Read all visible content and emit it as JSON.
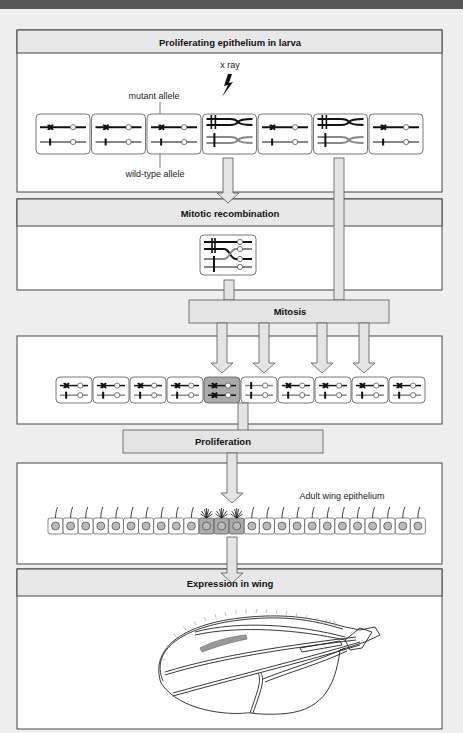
{
  "panels": {
    "larva": {
      "title": "Proliferating epithelium in larva"
    },
    "recombination": {
      "title": "Mitotic recombination"
    },
    "mitosis": {
      "title": "Mitosis"
    },
    "proliferation": {
      "title": "Proliferation"
    },
    "wing": {
      "title": "Expression in wing"
    }
  },
  "labels": {
    "xray": "x ray",
    "mutant_allele": "mutant allele",
    "wildtype_allele": "wild-type allele",
    "adult_wing_epithelium": "Adult wing epithelium"
  },
  "larva_cells": [
    "normal",
    "normal",
    "normal",
    "paired",
    "normal",
    "paired",
    "normal"
  ],
  "daughter_cells": [
    "normal",
    "normal",
    "normal",
    "normal",
    "homozygous-mutant",
    "homozygous-wildtype",
    "normal",
    "normal",
    "normal",
    "normal"
  ],
  "adult_cells": {
    "count": 25,
    "mutant_indices": [
      10,
      11,
      12
    ]
  },
  "colors": {
    "panel_header": "#e8e8e8",
    "arrow_fill": "#e4e4e4",
    "mutant_chromosome": "#111111",
    "wildtype_chromosome": "#888888",
    "mutant_cell": "#aaaaaa",
    "background": "#eeeeee"
  }
}
